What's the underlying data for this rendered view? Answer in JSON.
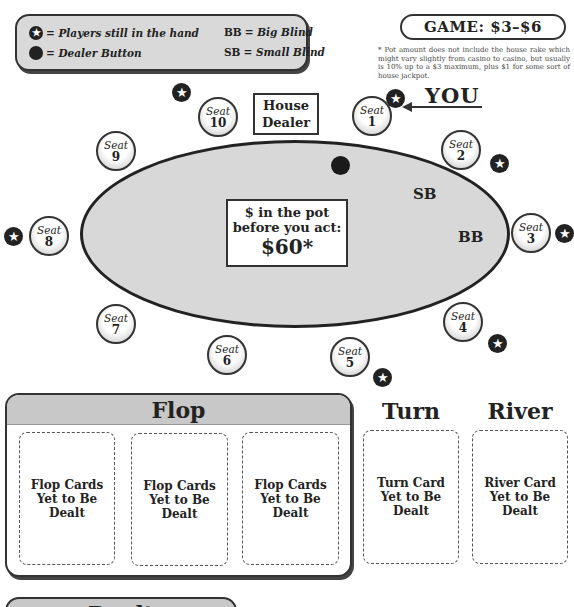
{
  "legend": {
    "star_meaning": "= Players still in the hand",
    "dot_meaning": "= Dealer Button",
    "bb_key": "BB",
    "bb_meaning": "= Big Blind",
    "sb_key": "SB",
    "sb_meaning": "= Small Blind",
    "star_glyph": "★"
  },
  "game": {
    "title": "GAME: $3–$6",
    "footnote": "* Pot amount does not include the house rake which might vary slightly from casino to casino, but usually is 10% up to a $3 maximum, plus $1 for some sort of house jackpot."
  },
  "table": {
    "house_dealer": "House Dealer",
    "you_label": "YOU",
    "sb_label": "SB",
    "bb_label": "BB",
    "pot": {
      "line1": "$ in the pot",
      "line2": "before you act:",
      "amount": "$60*"
    },
    "seats": [
      {
        "label": "Seat",
        "number": "1",
        "in_hand": true
      },
      {
        "label": "Seat",
        "number": "2",
        "in_hand": true
      },
      {
        "label": "Seat",
        "number": "3",
        "in_hand": true
      },
      {
        "label": "Seat",
        "number": "4",
        "in_hand": true
      },
      {
        "label": "Seat",
        "number": "5",
        "in_hand": true
      },
      {
        "label": "Seat",
        "number": "6",
        "in_hand": false
      },
      {
        "label": "Seat",
        "number": "7",
        "in_hand": false
      },
      {
        "label": "Seat",
        "number": "8",
        "in_hand": true
      },
      {
        "label": "Seat",
        "number": "9",
        "in_hand": false
      },
      {
        "label": "Seat",
        "number": "10",
        "in_hand": true
      }
    ],
    "dealer_button_at_seat": "1"
  },
  "board": {
    "flop_title": "Flop",
    "flop_cards": [
      "Flop Cards Yet to Be Dealt",
      "Flop Cards Yet to Be Dealt",
      "Flop Cards Yet to Be Dealt"
    ],
    "turn_title": "Turn",
    "turn_card": "Turn Card Yet to Be Dealt",
    "river_title": "River",
    "river_card": "River Card Yet to Be Dealt"
  },
  "bottom_section": {
    "title": "Dealt"
  }
}
